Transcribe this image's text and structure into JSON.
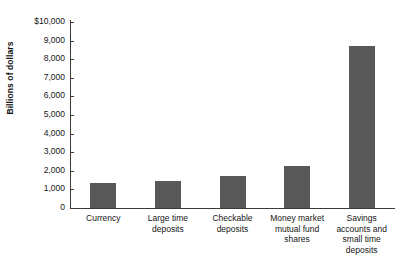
{
  "chart_data": {
    "type": "bar",
    "title": "",
    "xlabel": "",
    "ylabel": "Billions of dollars",
    "ylim": [
      0,
      10000
    ],
    "ytick_values": [
      0,
      1000,
      2000,
      3000,
      4000,
      5000,
      6000,
      7000,
      8000,
      9000,
      10000
    ],
    "ytick_labels": [
      "0",
      "1,000",
      "2,000",
      "3,000",
      "4,000",
      "5,000",
      "6,000",
      "7,000",
      "8,000",
      "9,000",
      "$10,000"
    ],
    "grid": false,
    "legend": null,
    "bar_color": "#595959",
    "axis_color": "#3a3a3a",
    "categories": [
      "Currency",
      "Large time deposits",
      "Checkable deposits",
      "Money market mutual fund shares",
      "Savings accounts and small time deposits"
    ],
    "category_label_lines": [
      [
        "Currency"
      ],
      [
        "Large time",
        "deposits"
      ],
      [
        "Checkable",
        "deposits"
      ],
      [
        "Money market",
        "mutual fund",
        "shares"
      ],
      [
        "Savings",
        "accounts and",
        "small time",
        "deposits"
      ]
    ],
    "values": [
      1350,
      1450,
      1700,
      2250,
      8700
    ]
  }
}
